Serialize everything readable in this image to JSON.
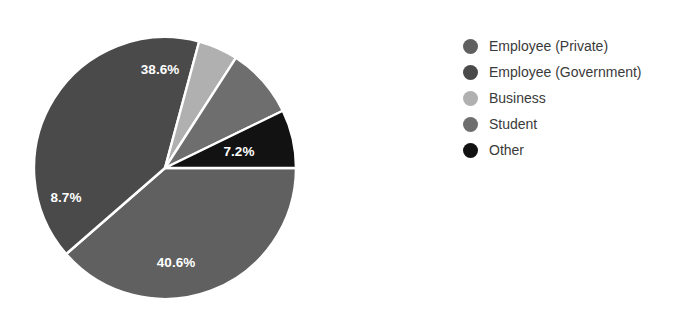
{
  "background_color": "#ffffff",
  "chart_data": {
    "type": "pie",
    "title": "",
    "subtitle": "",
    "xlabel": "",
    "ylabel": "",
    "grid": false,
    "legend_position": "right",
    "start_angle_deg": 0,
    "direction": "clockwise",
    "label_text_color": "#ffffff",
    "categories": [
      "Employee (Private)",
      "Employee (Government)",
      "Business",
      "Student",
      "Other"
    ],
    "values": [
      38.6,
      40.6,
      4.9,
      8.7,
      7.2
    ],
    "colors": [
      "#606060",
      "#4a4a4a",
      "#b0b0b0",
      "#6e6e6e",
      "#121212"
    ],
    "slices": [
      {
        "label": "Employee (Private)",
        "value": 38.6,
        "display": "38.6%",
        "color": "#606060",
        "label_visible": true,
        "label_x": 127,
        "label_y": 34
      },
      {
        "label": "Employee (Government)",
        "value": 40.6,
        "display": "40.6%",
        "color": "#4a4a4a",
        "label_visible": true,
        "label_x": 143,
        "label_y": 227
      },
      {
        "label": "Business",
        "value": 4.9,
        "display": "4.9%",
        "color": "#b0b0b0",
        "label_visible": false,
        "label_x": 48,
        "label_y": 112
      },
      {
        "label": "Student",
        "value": 8.7,
        "display": "8.7%",
        "color": "#6e6e6e",
        "label_visible": true,
        "label_x": 33,
        "label_y": 162
      },
      {
        "label": "Other",
        "value": 7.2,
        "display": "7.2%",
        "color": "#121212",
        "label_visible": true,
        "label_x": 206,
        "label_y": 116
      }
    ]
  },
  "legend": {
    "items": [
      {
        "label": "Employee (Private)",
        "color": "#606060"
      },
      {
        "label": "Employee (Government)",
        "color": "#4a4a4a"
      },
      {
        "label": "Business",
        "color": "#b0b0b0"
      },
      {
        "label": "Student",
        "color": "#6e6e6e"
      },
      {
        "label": "Other",
        "color": "#121212"
      }
    ]
  }
}
